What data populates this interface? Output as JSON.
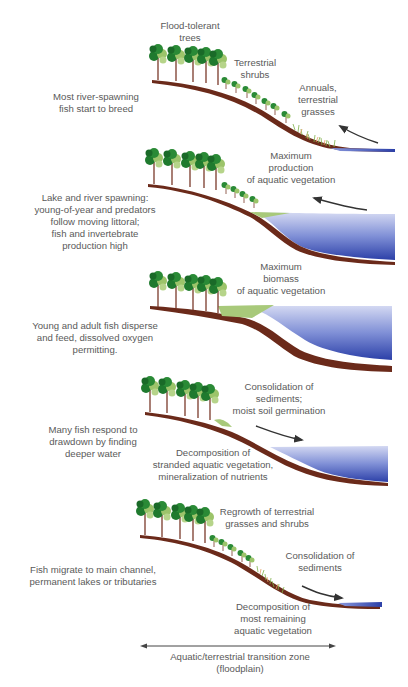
{
  "figure": {
    "colors": {
      "soil": "#6b2a1a",
      "water_light": "#c9cfee",
      "water_dark": "#2b3fa8",
      "tree_dark": "#1f7a2e",
      "tree_light": "#9cc46a",
      "trunk": "#7a3a2a",
      "grass": "#7fb04a",
      "aquatic_veg": "#a8c97a",
      "arrow": "#333333",
      "text": "#5a5a5a"
    },
    "panels": [
      {
        "id": "rising-limb",
        "labels": {
          "trees": [
            "Flood-tolerant",
            "trees"
          ],
          "shrubs": [
            "Terrestrial",
            "shrubs"
          ],
          "annuals": [
            "Annuals,",
            "terrestrial",
            "grasses"
          ],
          "fish": [
            "Most river-spawning",
            "fish start to breed"
          ]
        },
        "arrow_direction": "up-left"
      },
      {
        "id": "flooding",
        "labels": {
          "vegetation": [
            "Maximum",
            "production",
            "of aquatic vegetation"
          ],
          "fish": [
            "Lake and river spawning:",
            "young-of-year and predators",
            "follow moving littoral;",
            "fish and invertebrate",
            "production high"
          ]
        },
        "arrow_direction": "up-left"
      },
      {
        "id": "peak-flood",
        "labels": {
          "vegetation": [
            "Maximum",
            "biomass",
            "of aquatic vegetation"
          ],
          "fish": [
            "Young and adult fish disperse",
            "and feed, dissolved oxygen",
            "permitting."
          ]
        }
      },
      {
        "id": "falling-limb",
        "labels": {
          "sediments": [
            "Consolidation of",
            "sediments;",
            "moist soil germination"
          ],
          "fish": [
            "Many fish respond to",
            "drawdown by finding",
            "deeper water"
          ],
          "decomposition": [
            "Decomposition of",
            "stranded aquatic vegetation,",
            "mineralization of nutrients"
          ]
        },
        "arrow_direction": "down-right"
      },
      {
        "id": "low-water",
        "labels": {
          "regrowth": [
            "Regrowth of terrestrial",
            "grasses and shrubs"
          ],
          "sediments": [
            "Consolidation of",
            "sediments"
          ],
          "fish": [
            "Fish migrate to main channel,",
            "permanent lakes or tributaries"
          ],
          "decomposition": [
            "Decomposition of",
            "most remaining",
            "aquatic vegetation"
          ]
        },
        "arrow_direction": "down-right"
      }
    ],
    "zone_axis": {
      "label": [
        "Aquatic/terrestrial transition zone",
        "(floodplain)"
      ]
    }
  }
}
